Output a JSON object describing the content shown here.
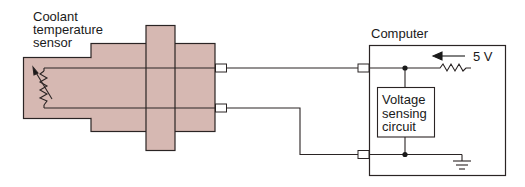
{
  "diagram": {
    "sensor": {
      "label_lines": [
        "Coolant",
        "temperature",
        "sensor"
      ],
      "fill_color": "#d6b8b2",
      "stroke_color": "#2a2424"
    },
    "computer": {
      "label": "Computer",
      "circuit_label_lines": [
        "Voltage",
        "sensing",
        "circuit"
      ],
      "supply_voltage": "5 V"
    },
    "components": [
      "thermistor-variable-resistor",
      "sensor-body",
      "mounting-flange",
      "signal-wire",
      "ground-return-wire",
      "connector-pins",
      "pull-up-resistor",
      "current-arrow",
      "voltage-sensing-circuit",
      "junction-dots",
      "ground-symbol"
    ]
  }
}
